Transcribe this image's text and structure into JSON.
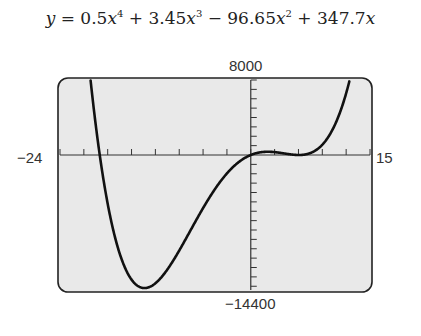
{
  "title": {
    "prefix": "y = 0.5x",
    "full": "y = 0.5x^4 + 3.45x^3 − 96.65x^2 + 347.7x",
    "terms": [
      {
        "coef": "0.5",
        "power": "4",
        "sign": ""
      },
      {
        "coef": "3.45",
        "power": "3",
        "sign": "+"
      },
      {
        "coef": "96.65",
        "power": "2",
        "sign": "−"
      },
      {
        "coef": "347.7",
        "power": "",
        "sign": "+"
      }
    ]
  },
  "window": {
    "ymax_label": "8000",
    "ymin_label": "−14400",
    "xmin_label": "−24",
    "xmax_label": "15"
  },
  "chart_data": {
    "type": "line",
    "xlabel": "",
    "ylabel": "",
    "xlim": [
      -24,
      15
    ],
    "ylim": [
      -14400,
      8000
    ],
    "xscale_ticks": 3,
    "yscale_ticks": 1000,
    "grid": false,
    "coefficients": {
      "x4": 0.5,
      "x3": 3.45,
      "x2": -96.65,
      "x1": 347.7,
      "x0": 0
    },
    "series": [
      {
        "name": "y = 0.5x^4 + 3.45x^3 − 96.65x^2 + 347.7x",
        "x": [
          -20,
          -18,
          -16,
          -15,
          -14,
          -12,
          -10,
          -8,
          -6,
          -4,
          -2,
          0,
          2,
          4,
          6,
          8,
          10,
          12
        ],
        "y": [
          7246,
          -1100,
          -7770,
          -10000,
          -11590,
          -12890,
          -11692,
          -8775,
          -5168,
          -1874,
          -1147,
          0,
          478,
          198,
          140,
          968,
          3023,
          7265
        ]
      }
    ]
  }
}
